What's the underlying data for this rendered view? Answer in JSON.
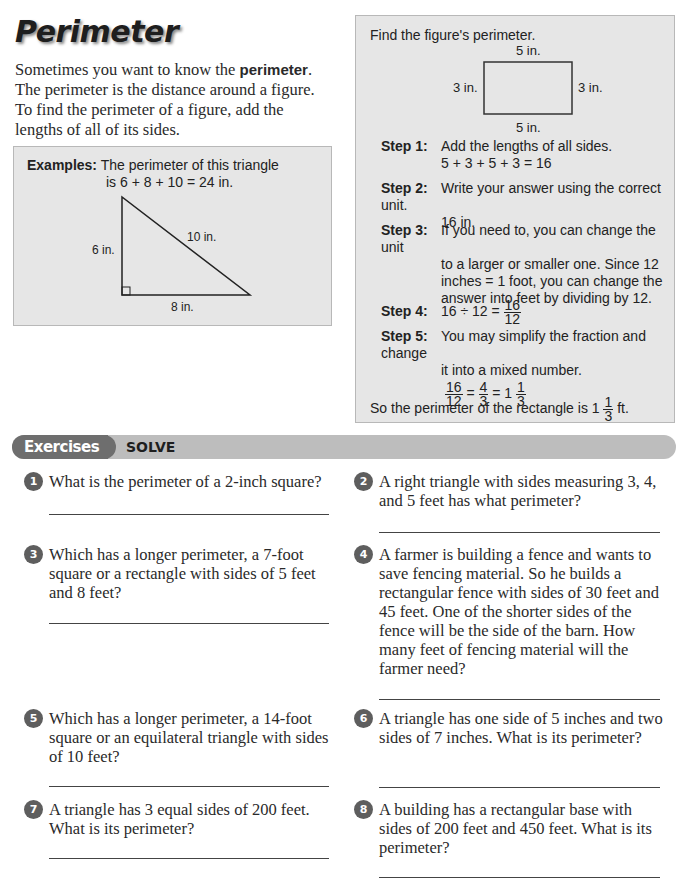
{
  "title": "Perimeter",
  "intro": {
    "before": "Sometimes you want to know the ",
    "bold": "perimeter",
    "after": ". The perimeter is the distance around a figure. To find the perimeter of a figure, add the lengths of all of its sides."
  },
  "example": {
    "label": "Examples:",
    "line1": "The perimeter of this triangle",
    "line2": "is 6 + 8 + 10 = 24 in.",
    "side_a": "6 in.",
    "side_b": "8 in.",
    "hypotenuse": "10 in."
  },
  "solve_box": {
    "find": "Find the figure's perimeter.",
    "top": "5 in.",
    "bottom": "5 in.",
    "left": "3 in.",
    "right": "3 in.",
    "steps": [
      {
        "label": "Step 1:",
        "text": "Add the lengths of all sides.",
        "extra": "5 + 3 + 5 + 3 = 16"
      },
      {
        "label": "Step 2:",
        "text": "Write your answer using the correct unit.",
        "extra": "16 in."
      },
      {
        "label": "Step 3:",
        "text": "If you need to, you can change the unit",
        "l2": "to a larger or smaller one. Since 12",
        "l3": "inches = 1 foot, you can change the",
        "l4": "answer into feet by dividing by 12."
      },
      {
        "label": "Step 4:",
        "text": "16 ÷ 12 =",
        "num": "16",
        "den": "12"
      },
      {
        "label": "Step 5:",
        "text": "You may simplify the fraction and change",
        "l2": "it into a mixed number."
      }
    ],
    "simplify": {
      "n1": "16",
      "d1": "12",
      "eq1": "=",
      "n2": "4",
      "d2": "3",
      "eq2": "= 1",
      "n3": "1",
      "d3": "3"
    },
    "final_before": "So the perimeter of the rectangle is 1",
    "final_num": "1",
    "final_den": "3",
    "final_after": "ft."
  },
  "exercises": {
    "pill": "Exercises",
    "label": "SOLVE",
    "items": [
      {
        "n": "1",
        "text": "What is the perimeter of a 2-inch square?"
      },
      {
        "n": "2",
        "text": "A right triangle with sides measuring 3, 4, and 5 feet has what perimeter?"
      },
      {
        "n": "3",
        "text": "Which has a longer perimeter, a 7-foot square or a rectangle with sides of 5 feet and 8 feet?"
      },
      {
        "n": "4",
        "text": "A farmer is building a fence and wants to save fencing material. So he builds a rectangular fence with sides of 30 feet and 45 feet. One of the shorter sides of the fence will be the side of the barn. How many feet of fencing material will the farmer need?"
      },
      {
        "n": "5",
        "text": "Which has a longer perimeter, a 14-foot square or an equilateral triangle with sides of 10 feet?"
      },
      {
        "n": "6",
        "text": "A triangle has one side of 5 inches and two sides of 7 inches. What is its perimeter?"
      },
      {
        "n": "7",
        "text": "A triangle has 3 equal sides of 200 feet. What is its perimeter?"
      },
      {
        "n": "8",
        "text": "A building has a rectangular base with sides of 200 feet and 450 feet. What is its perimeter?"
      }
    ]
  }
}
